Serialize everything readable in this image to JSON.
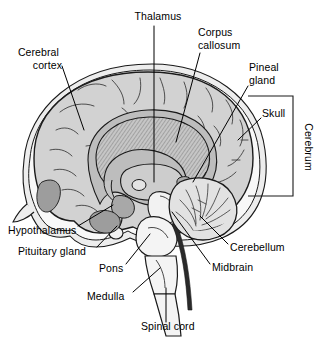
{
  "figure": {
    "type": "anatomical-diagram",
    "style": "grayscale line drawing",
    "colors": {
      "background": "#ffffff",
      "outline": "#1a1a1a",
      "cortex_fill": "#d2d2d2",
      "white_matter_fill": "#bdbdbd",
      "corpus_callosum_fill": "#c4c4c4",
      "brainstem_fill": "#f2f2f2",
      "cerebellum_fill": "#e2e2e2",
      "skull_fill": "#f7f7f7",
      "scalp_fill": "#ededed",
      "dark_structure_fill": "#9a9a9a",
      "label_text": "#000000",
      "leader_line": "#000000"
    }
  },
  "labels": [
    {
      "id": "thalamus",
      "text": "Thalamus",
      "x": 158,
      "y": 16,
      "anchor": "middle",
      "lines": [
        "Thalamus"
      ]
    },
    {
      "id": "corpus-callosum",
      "text": "Corpus callosum",
      "x": 198,
      "y": 37,
      "anchor": "start",
      "lines": [
        "Corpus",
        "callosum"
      ]
    },
    {
      "id": "cerebral-cortex",
      "text": "Cerebral cortex",
      "x": 62,
      "y": 57,
      "anchor": "end",
      "lines": [
        "Cerebral",
        "cortex"
      ]
    },
    {
      "id": "pineal-gland",
      "text": "Pineal gland",
      "x": 249,
      "y": 72,
      "anchor": "start",
      "lines": [
        "Pineal",
        "gland"
      ]
    },
    {
      "id": "skull",
      "text": "Skull",
      "x": 262,
      "y": 115,
      "anchor": "start",
      "lines": [
        "Skull"
      ]
    },
    {
      "id": "cerebrum",
      "text": "Cerebrum",
      "x": 303,
      "y": 145,
      "anchor": "middle",
      "rotated": true,
      "lines": [
        "Cerebrum"
      ]
    },
    {
      "id": "hypothalamus",
      "text": "Hypothalamus",
      "x": 8,
      "y": 231,
      "anchor": "start",
      "lines": [
        "Hypothalamus"
      ]
    },
    {
      "id": "pituitary-gland",
      "text": "Pituitary gland",
      "x": 18,
      "y": 252,
      "anchor": "start",
      "lines": [
        "Pituitary gland"
      ]
    },
    {
      "id": "pons",
      "text": "Pons",
      "x": 98,
      "y": 270,
      "anchor": "start",
      "lines": [
        "Pons"
      ]
    },
    {
      "id": "medulla",
      "text": "Medulla",
      "x": 86,
      "y": 297,
      "anchor": "start",
      "lines": [
        "Medulla"
      ]
    },
    {
      "id": "spinal-cord",
      "text": "Spinal cord",
      "x": 141,
      "y": 327,
      "anchor": "start",
      "lines": [
        "Spinal cord"
      ]
    },
    {
      "id": "cerebellum",
      "text": "Cerebellum",
      "x": 230,
      "y": 248,
      "anchor": "start",
      "lines": [
        "Cerebellum"
      ]
    },
    {
      "id": "midbrain",
      "text": "Midbrain",
      "x": 212,
      "y": 268,
      "anchor": "start",
      "lines": [
        "Midbrain"
      ]
    }
  ],
  "bracket": {
    "id": "cerebrum-bracket",
    "top": 96,
    "bottom": 196,
    "left": 248,
    "right": 293
  },
  "structures": [
    {
      "id": "scalp",
      "name": "Scalp / outer head contour"
    },
    {
      "id": "skull",
      "name": "Skull"
    },
    {
      "id": "cerebral-cortex",
      "name": "Cerebral cortex"
    },
    {
      "id": "corpus-callosum",
      "name": "Corpus callosum"
    },
    {
      "id": "thalamus",
      "name": "Thalamus"
    },
    {
      "id": "pineal-gland",
      "name": "Pineal gland"
    },
    {
      "id": "hypothalamus",
      "name": "Hypothalamus"
    },
    {
      "id": "pituitary-gland",
      "name": "Pituitary gland"
    },
    {
      "id": "midbrain",
      "name": "Midbrain"
    },
    {
      "id": "pons",
      "name": "Pons"
    },
    {
      "id": "medulla",
      "name": "Medulla"
    },
    {
      "id": "cerebellum",
      "name": "Cerebellum"
    },
    {
      "id": "spinal-cord",
      "name": "Spinal cord"
    }
  ]
}
